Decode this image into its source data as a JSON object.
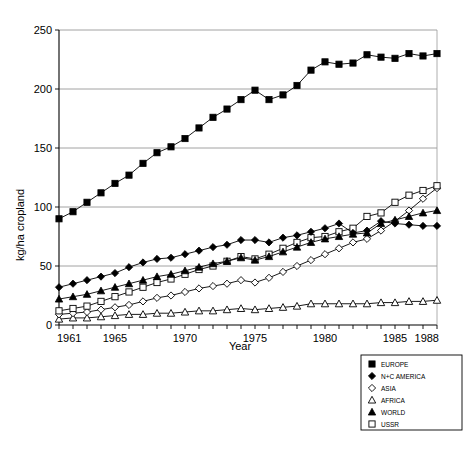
{
  "chart_data": {
    "type": "line",
    "title": "",
    "xlabel": "Year",
    "ylabel": "kg/ha cropland",
    "xlim": [
      1961,
      1988
    ],
    "ylim": [
      0,
      250
    ],
    "yticks": [
      0,
      50,
      100,
      150,
      200,
      250
    ],
    "xticks": [
      1961,
      1965,
      1970,
      1975,
      1980,
      1985,
      1988
    ],
    "xtick_labels": [
      "1961",
      "1965",
      "1970",
      "1975",
      "1980",
      "1985",
      "1988"
    ],
    "ytick_labels": [
      "0",
      "50",
      "100",
      "150",
      "200",
      "250"
    ],
    "grid": "horizontal",
    "legend_position": "below-right-outside",
    "x": [
      1961,
      1962,
      1963,
      1964,
      1965,
      1966,
      1967,
      1968,
      1969,
      1970,
      1971,
      1972,
      1973,
      1974,
      1975,
      1976,
      1977,
      1978,
      1979,
      1980,
      1981,
      1982,
      1983,
      1984,
      1985,
      1986,
      1987,
      1988
    ],
    "series": [
      {
        "name": "EUROPE",
        "marker": "filled-square",
        "values": [
          90,
          96,
          104,
          112,
          120,
          127,
          137,
          146,
          151,
          158,
          167,
          176,
          183,
          191,
          199,
          191,
          195,
          203,
          216,
          223,
          221,
          222,
          229,
          227,
          226,
          230,
          228,
          230
        ]
      },
      {
        "name": "N+C AMERICA",
        "marker": "filled-diamond",
        "values": [
          32,
          35,
          38,
          41,
          44,
          49,
          53,
          56,
          57,
          60,
          63,
          66,
          68,
          72,
          72,
          70,
          74,
          76,
          79,
          82,
          86,
          78,
          80,
          88,
          86,
          85,
          84,
          84
        ]
      },
      {
        "name": "ASIA",
        "marker": "open-diamond",
        "values": [
          9,
          10,
          11,
          13,
          15,
          17,
          20,
          23,
          25,
          28,
          31,
          33,
          35,
          38,
          36,
          40,
          45,
          50,
          55,
          60,
          65,
          70,
          73,
          80,
          88,
          97,
          107,
          116
        ]
      },
      {
        "name": "AFRICA",
        "marker": "open-triangle",
        "values": [
          5,
          6,
          6,
          7,
          8,
          9,
          9,
          10,
          10,
          11,
          12,
          12,
          13,
          14,
          13,
          14,
          15,
          16,
          18,
          18,
          18,
          18,
          18,
          19,
          19,
          20,
          20,
          21
        ]
      },
      {
        "name": "WORLD",
        "marker": "filled-triangle",
        "values": [
          22,
          24,
          26,
          29,
          32,
          35,
          38,
          41,
          43,
          46,
          49,
          52,
          54,
          57,
          55,
          58,
          62,
          66,
          70,
          73,
          75,
          77,
          78,
          86,
          89,
          92,
          95,
          97
        ]
      },
      {
        "name": "USSR",
        "marker": "open-square",
        "values": [
          12,
          14,
          16,
          20,
          24,
          28,
          32,
          36,
          39,
          43,
          47,
          50,
          54,
          58,
          56,
          60,
          65,
          70,
          74,
          75,
          79,
          82,
          92,
          95,
          104,
          110,
          114,
          118
        ]
      }
    ]
  },
  "legend": {
    "items": [
      {
        "label": "EUROPE",
        "marker": "filled-square"
      },
      {
        "label": "N+C AMERICA",
        "marker": "filled-diamond"
      },
      {
        "label": "ASIA",
        "marker": "open-diamond"
      },
      {
        "label": "AFRICA",
        "marker": "open-triangle"
      },
      {
        "label": "WORLD",
        "marker": "filled-triangle"
      },
      {
        "label": "USSR",
        "marker": "open-square"
      }
    ]
  },
  "colors": {
    "ink": "#000000",
    "grid": "#8c8c8c",
    "background": "#ffffff"
  }
}
